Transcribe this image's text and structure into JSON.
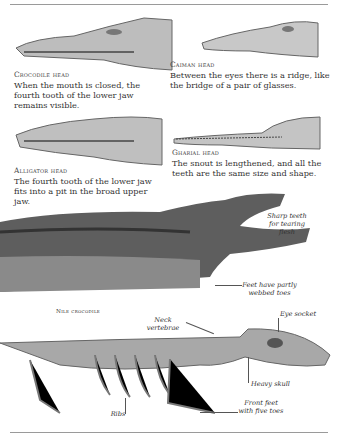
{
  "heads": [
    {
      "title": "Crocodile head",
      "text": "When the mouth is closed, the fourth tooth of the lower jaw remains visible."
    },
    {
      "title": "Caiman head",
      "text": "Between the eyes there is a ridge, like the bridge of a pair of glasses."
    },
    {
      "title": "Alligator head",
      "text": "The fourth tooth of the lower jaw fits into a pit in the broad upper jaw."
    },
    {
      "title": "Gharial head",
      "text": "The snout is lengthened, and all the teeth are the same size and shape."
    }
  ],
  "nile": {
    "caption": "Nile crocodile",
    "labels": [
      "Sharp teeth for tearing flesh",
      "Feet have partly webbed toes"
    ]
  },
  "skeleton": {
    "labels": [
      "Neck vertebrae",
      "Eye socket",
      "Heavy skull",
      "Front feet with five toes",
      "Ribs"
    ]
  }
}
